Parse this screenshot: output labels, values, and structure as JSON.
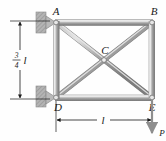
{
  "figure": {
    "type": "truss-free-body-diagram",
    "background_color": "#fefefe",
    "member_color": "#9a9a9a",
    "member_highlight_color": "#d8d8d8",
    "member_shadow_color": "#6f6f6f",
    "line_color": "#1a1a1a",
    "support_color": "#a8a8a8"
  },
  "nodes": {
    "A": {
      "label": "A",
      "x": 56,
      "y": 22
    },
    "B": {
      "label": "B",
      "x": 152,
      "y": 22
    },
    "C": {
      "label": "C",
      "x": 104,
      "y": 60
    },
    "D": {
      "label": "D",
      "x": 56,
      "y": 98
    },
    "E": {
      "label": "E",
      "x": 152,
      "y": 98
    }
  },
  "dimensions": {
    "vertical": {
      "label_numerator": "3",
      "label_denominator": "4",
      "label_unit": "l",
      "value_text": "3/4 l"
    },
    "horizontal": {
      "label": "l"
    }
  },
  "load": {
    "label": "P",
    "direction": "down"
  },
  "supports": [
    {
      "name": "pin-support-A",
      "at_node": "A",
      "type": "pin"
    },
    {
      "name": "pin-support-D",
      "at_node": "D",
      "type": "pin"
    }
  ],
  "members": [
    {
      "from": "A",
      "to": "B"
    },
    {
      "from": "A",
      "to": "D"
    },
    {
      "from": "B",
      "to": "E"
    },
    {
      "from": "D",
      "to": "E"
    },
    {
      "from": "A",
      "to": "E"
    },
    {
      "from": "D",
      "to": "B"
    }
  ]
}
